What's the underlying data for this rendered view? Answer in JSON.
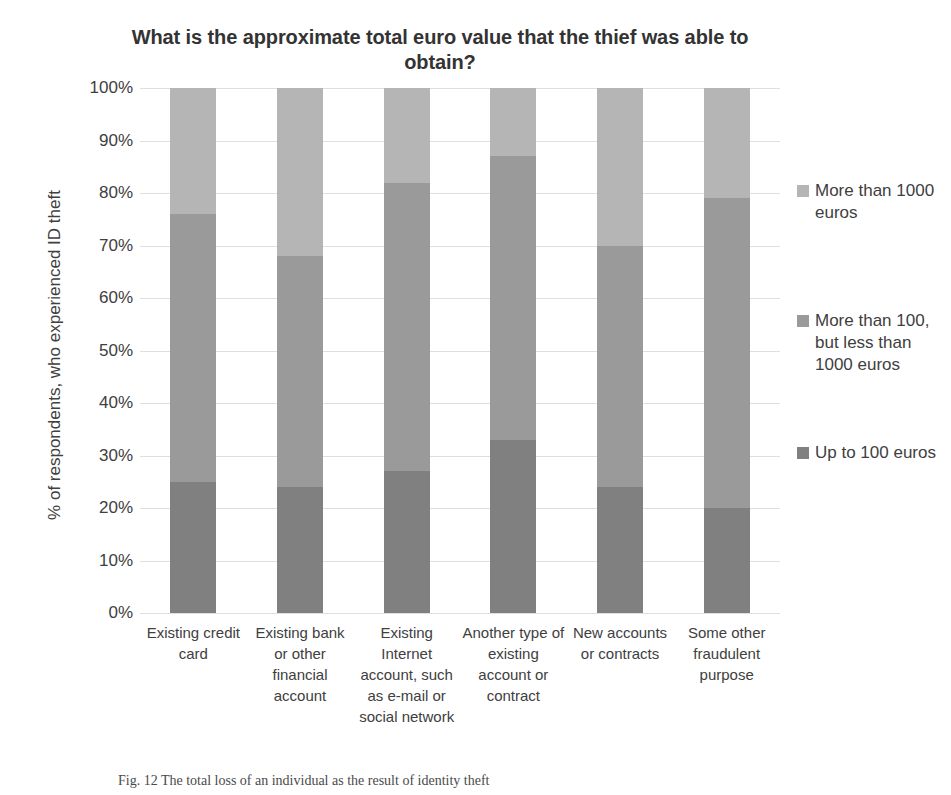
{
  "chart_data": {
    "type": "bar",
    "subtype": "stacked-bar-100-percent",
    "title": "What is the approximate total euro value that the thief was able to obtain?",
    "xlabel": "",
    "ylabel": "% of respondents, who experienced ID theft",
    "ylim": [
      0,
      100
    ],
    "ytick_labels": [
      "100%",
      "90%",
      "80%",
      "70%",
      "60%",
      "50%",
      "40%",
      "30%",
      "20%",
      "10%",
      "0%"
    ],
    "ytick_values": [
      100,
      90,
      80,
      70,
      60,
      50,
      40,
      30,
      20,
      10,
      0
    ],
    "grid": true,
    "legend_position": "right",
    "categories": [
      "Existing credit card",
      "Existing bank or other financial account",
      "Existing Internet account, such as e-mail or social network",
      "Another type of existing account or contract",
      "New accounts or contracts",
      "Some other fraudulent purpose"
    ],
    "series": [
      {
        "name": "Up to 100 euros",
        "color": "#808080",
        "values": [
          25,
          24,
          27,
          33,
          24,
          20
        ]
      },
      {
        "name": "More than 100, but less than 1000 euros",
        "color": "#9a9a9a",
        "values": [
          51,
          44,
          55,
          54,
          46,
          59
        ]
      },
      {
        "name": "More than 1000 euros",
        "color": "#b5b5b5",
        "values": [
          24,
          32,
          18,
          13,
          30,
          21
        ]
      }
    ]
  },
  "legend": {
    "items": [
      {
        "label": "More than 1000 euros",
        "color": "#b5b5b5"
      },
      {
        "label": "More than 100, but less than 1000 euros",
        "color": "#9a9a9a"
      },
      {
        "label": "Up to 100 euros",
        "color": "#808080"
      }
    ]
  },
  "caption": {
    "text": "Fig. 12  The total loss of an individual as the result of identity theft"
  }
}
